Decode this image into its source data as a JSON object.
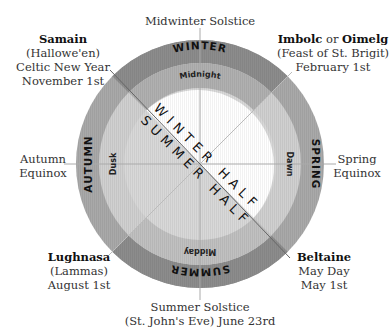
{
  "diagram": {
    "center": {
      "x": 200,
      "y": 164
    },
    "radii": {
      "outer": 124,
      "middle": 101,
      "inner": 76
    },
    "colors": {
      "winter_outer": "#8f8f8f",
      "winter_middle": "#b3b3b3",
      "summer_outer": "#8f8f8f",
      "summer_middle": "#c4c4c4",
      "spring_autumn_outer": "#a8a8a8",
      "light_fill": "#d9d9d9",
      "inner_winter": "#ffffff",
      "inner_summer": "#d6d6d6",
      "lines": "#aaaaaa"
    },
    "seasons": {
      "top": "WINTER",
      "right": "SPRING",
      "bottom": "SUMMER",
      "left": "AUTUMN"
    },
    "times_of_day": {
      "top": "Midnight",
      "right": "Dawn",
      "bottom": "Midday",
      "left": "Dusk"
    },
    "halves": {
      "winter": "WINTER HALF",
      "summer": "SUMMER HALF"
    }
  },
  "labels": {
    "midwinter": {
      "line1": "Midwinter Solstice"
    },
    "samain": {
      "name": "Samain",
      "line2": "(Hallowe'en)",
      "line3": "Celtic New Year",
      "line4": "November 1st"
    },
    "imbolc": {
      "name1": "Imbolc",
      "connector": "or",
      "name2": "Oimelg",
      "line2": "(Feast of St. Brigit)",
      "line3": "February 1st"
    },
    "autumn_equinox": {
      "line1": "Autumn",
      "line2": "Equinox"
    },
    "spring_equinox": {
      "line1": "Spring",
      "line2": "Equinox"
    },
    "lughnasa": {
      "name": "Lughnasa",
      "line2": "(Lammas)",
      "line3": "August 1st"
    },
    "beltaine": {
      "name": "Beltaine",
      "line2": "May Day",
      "line3": "May 1st"
    },
    "midsummer": {
      "line1": "Summer Solstice",
      "line2": "(St. John's Eve) June 23rd"
    }
  }
}
